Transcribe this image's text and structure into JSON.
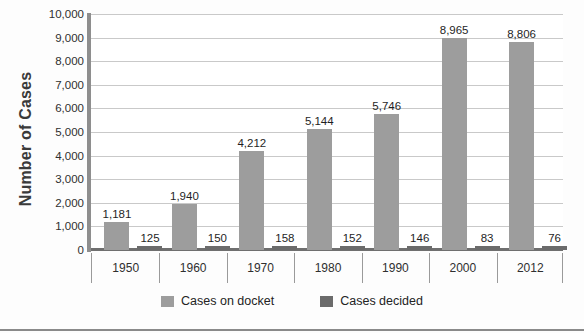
{
  "chart_data": {
    "type": "bar",
    "title": "",
    "xlabel": "",
    "ylabel": "Number of Cases",
    "categories": [
      "1950",
      "1960",
      "1970",
      "1980",
      "1990",
      "2000",
      "2012"
    ],
    "series": [
      {
        "name": "Cases on docket",
        "color": "#9d9d9d",
        "values": [
          1181,
          1940,
          4212,
          5144,
          5746,
          8965,
          8806
        ],
        "labels": [
          "1,181",
          "1,940",
          "4,212",
          "5,144",
          "5,746",
          "8,965",
          "8,806"
        ]
      },
      {
        "name": "Cases decided",
        "color": "#6b6b6b",
        "values": [
          125,
          150,
          158,
          152,
          146,
          83,
          76
        ],
        "labels": [
          "125",
          "150",
          "158",
          "152",
          "146",
          "83",
          "76"
        ]
      }
    ],
    "ylim": [
      0,
      10000
    ],
    "ytick_values": [
      0,
      1000,
      2000,
      3000,
      4000,
      5000,
      6000,
      7000,
      8000,
      9000,
      10000
    ],
    "ytick_labels": [
      "0",
      "1,000",
      "2,000",
      "3,000",
      "4,000",
      "5,000",
      "6,000",
      "7,000",
      "8,000",
      "9,000",
      "10,000"
    ],
    "grid": true,
    "legend_position": "bottom"
  },
  "axis": {
    "y_title": "Number of Cases"
  },
  "legend": {
    "items": [
      {
        "label": "Cases on docket",
        "color": "#9d9d9d"
      },
      {
        "label": "Cases decided",
        "color": "#6b6b6b"
      }
    ]
  }
}
